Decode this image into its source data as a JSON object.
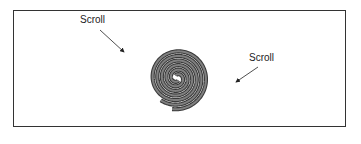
{
  "diagram": {
    "type": "scroll-spiral",
    "labels": [
      {
        "text": "Scroll",
        "x": 80,
        "y": 14
      },
      {
        "text": "Scroll",
        "x": 250,
        "y": 52
      }
    ],
    "colors": {
      "stroke": "#3a3a3a",
      "fill": "#808080",
      "frame": "#333333"
    }
  }
}
